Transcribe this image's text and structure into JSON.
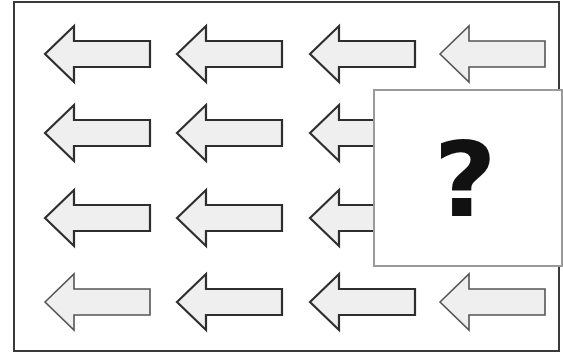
{
  "puzzle": {
    "type": "pattern-completion",
    "grid": {
      "rows": 4,
      "columns": 4,
      "column_tip_x": [
        45,
        177,
        310,
        440
      ],
      "row_center_y": [
        54,
        133,
        218,
        302
      ],
      "arrow_length": 105,
      "head_length": 29,
      "head_half_height": 28,
      "shaft_half_height": 13
    },
    "cells": [
      {
        "row": 1,
        "col": 1,
        "symbol": "arrow-left"
      },
      {
        "row": 1,
        "col": 2,
        "symbol": "arrow-left"
      },
      {
        "row": 1,
        "col": 3,
        "symbol": "arrow-left"
      },
      {
        "row": 1,
        "col": 4,
        "symbol": "arrow-left"
      },
      {
        "row": 2,
        "col": 1,
        "symbol": "arrow-left"
      },
      {
        "row": 2,
        "col": 2,
        "symbol": "arrow-left"
      },
      {
        "row": 2,
        "col": 3,
        "symbol": "arrow-left",
        "partially_hidden": true
      },
      {
        "row": 2,
        "col": 4,
        "symbol": "hidden"
      },
      {
        "row": 3,
        "col": 1,
        "symbol": "arrow-left"
      },
      {
        "row": 3,
        "col": 2,
        "symbol": "arrow-left"
      },
      {
        "row": 3,
        "col": 3,
        "symbol": "arrow-left",
        "partially_hidden": true
      },
      {
        "row": 3,
        "col": 4,
        "symbol": "hidden"
      },
      {
        "row": 4,
        "col": 1,
        "symbol": "arrow-left"
      },
      {
        "row": 4,
        "col": 2,
        "symbol": "arrow-left"
      },
      {
        "row": 4,
        "col": 3,
        "symbol": "arrow-left"
      },
      {
        "row": 4,
        "col": 4,
        "symbol": "arrow-left"
      }
    ],
    "question_box": {
      "label": "?",
      "covers": "rows 2-3, columns 3-4"
    },
    "colors": {
      "arrow_fill": "#efefef",
      "arrow_stroke": "#2e2e2e",
      "frame_border": "#3a3a3a",
      "question_box_border": "#9a9a9a",
      "question_mark": "#111111"
    }
  }
}
